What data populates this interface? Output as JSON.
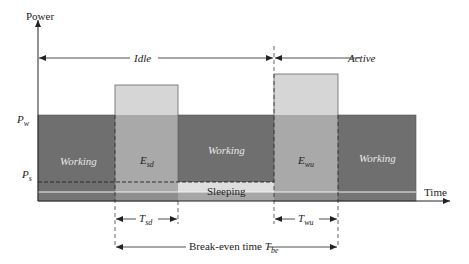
{
  "diagram": {
    "axes": {
      "y_label": "Power",
      "x_label": "Time",
      "levels": {
        "pw": {
          "main": "P",
          "sub": "w"
        },
        "ps": {
          "main": "P",
          "sub": "s"
        }
      }
    },
    "phases": {
      "idle": "Idle",
      "active": "Active"
    },
    "blocks": [
      {
        "id": "working-1",
        "label": "Working"
      },
      {
        "id": "esd",
        "label_main": "E",
        "label_sub": "sd"
      },
      {
        "id": "working-2",
        "label": "Working"
      },
      {
        "id": "sleeping",
        "label": "Sleeping"
      },
      {
        "id": "ewu",
        "label_main": "E",
        "label_sub": "wu"
      },
      {
        "id": "working-3",
        "label": "Working"
      }
    ],
    "intervals": {
      "tsd": {
        "main": "T",
        "sub": "sd"
      },
      "twu": {
        "main": "T",
        "sub": "wu"
      },
      "break_even": {
        "prefix": "Break-even time ",
        "main": "T",
        "sub": "be"
      }
    },
    "colors": {
      "working": "#6f6f6f",
      "transition_low": "#a9a9a9",
      "transition_high": "#d6d6d6",
      "sleeping": "#dedede",
      "line": "#222222"
    }
  }
}
